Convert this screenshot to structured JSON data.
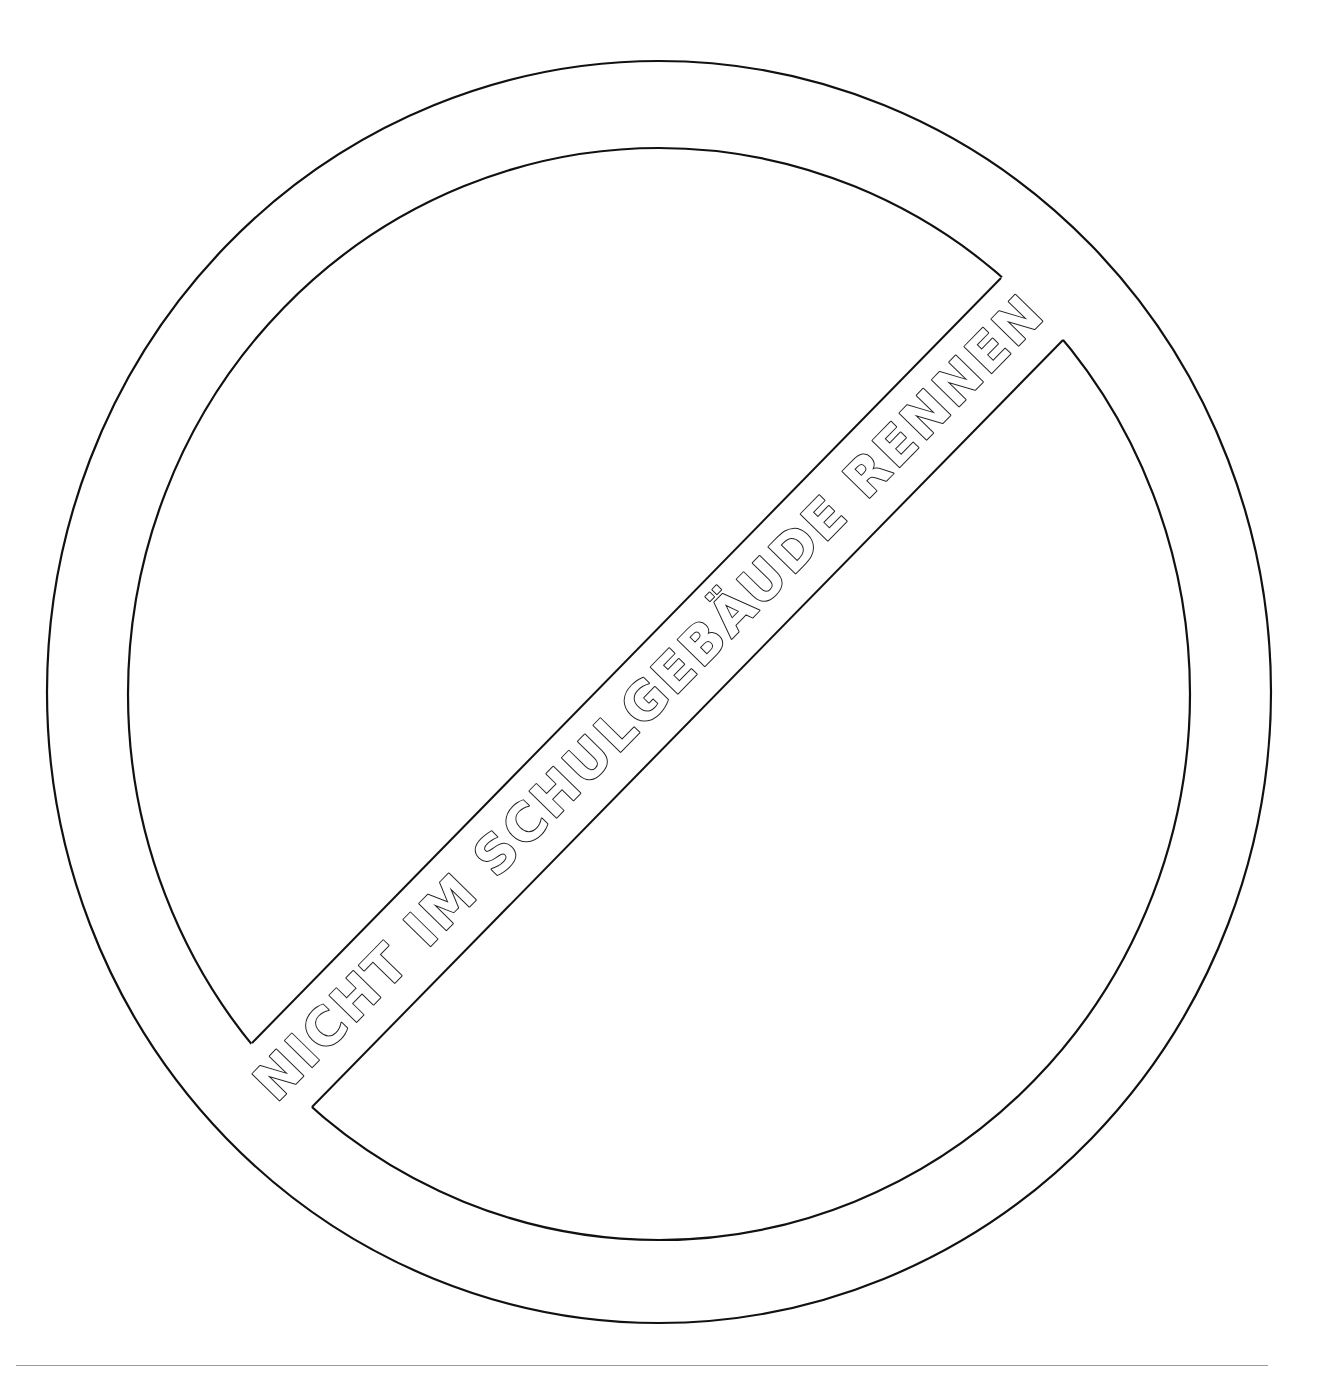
{
  "sign": {
    "type": "prohibition-sign-coloring-page",
    "banner_text": "NICHT IM SCHULGEBÄUDE RENNEN",
    "stroke_color": "#111111",
    "fill_color": "#ffffff",
    "background_color": "#ffffff"
  },
  "footer": {
    "rule_color": "#9a9a9a"
  }
}
